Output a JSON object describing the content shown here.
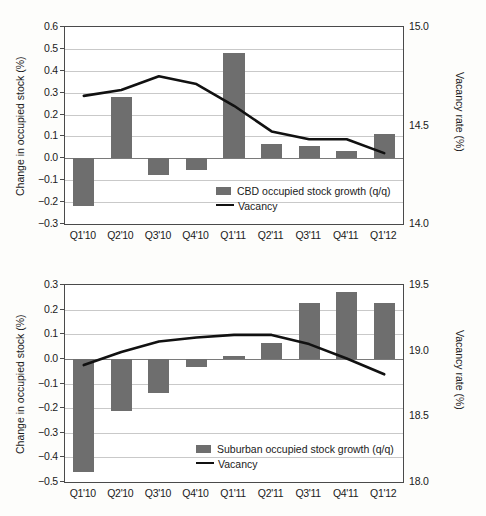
{
  "colors": {
    "bar": "#6e6e6e",
    "line": "#111111",
    "grid": "#c9c9c9",
    "axis": "#4a4a4a",
    "background": "#ffffff"
  },
  "chart_data": [
    {
      "type": "bar",
      "id": "cbd",
      "title": "",
      "xlabel": "",
      "ylabel": "Change in occupied stock (%)",
      "y2label": "Vacancy rate (%)",
      "categories": [
        "Q1'10",
        "Q2'10",
        "Q3'10",
        "Q4'10",
        "Q1'11",
        "Q2'11",
        "Q3'11",
        "Q4'11",
        "Q1'12"
      ],
      "ylim": [
        -0.3,
        0.6
      ],
      "yticks": [
        "0.6",
        "0.5",
        "0.4",
        "0.3",
        "0.2",
        "0.1",
        "0.0",
        "-0.1",
        "-0.2",
        "-0.3"
      ],
      "y2lim": [
        14.0,
        15.0
      ],
      "y2ticks": [
        "15.0",
        "14.5",
        "14.0"
      ],
      "grid": true,
      "legend_position": "inside-bottom-right",
      "series": [
        {
          "name": "CBD occupied stock growth (q/q)",
          "type": "bar",
          "axis": "left",
          "values": [
            -0.22,
            0.28,
            -0.075,
            -0.055,
            0.48,
            0.065,
            0.055,
            0.035,
            0.11
          ]
        },
        {
          "name": "Vacancy",
          "type": "line",
          "axis": "right",
          "values": [
            14.65,
            14.68,
            14.75,
            14.71,
            14.6,
            14.47,
            14.43,
            14.43,
            14.36
          ]
        }
      ]
    },
    {
      "type": "bar",
      "id": "suburban",
      "title": "",
      "xlabel": "",
      "ylabel": "Change in occupied stock (%)",
      "y2label": "Vacancy rate (%)",
      "categories": [
        "Q1'10",
        "Q2'10",
        "Q3'10",
        "Q4'10",
        "Q1'11",
        "Q2'11",
        "Q3'11",
        "Q4'11",
        "Q1'12"
      ],
      "ylim": [
        -0.5,
        0.3
      ],
      "yticks": [
        "0.3",
        "0.2",
        "0.1",
        "0.0",
        "-0.1",
        "-0.2",
        "-0.3",
        "-0.4",
        "-0.5"
      ],
      "y2lim": [
        18.0,
        19.5
      ],
      "y2ticks": [
        "19.5",
        "19.0",
        "18.5",
        "18.0"
      ],
      "grid": true,
      "legend_position": "inside-bottom-right",
      "series": [
        {
          "name": "Suburban occupied stock growth (q/q)",
          "type": "bar",
          "axis": "left",
          "values": [
            -0.46,
            -0.21,
            -0.14,
            -0.035,
            0.01,
            0.065,
            0.225,
            0.27,
            0.225
          ]
        },
        {
          "name": "Vacancy",
          "type": "line",
          "axis": "right",
          "values": [
            18.89,
            18.99,
            19.07,
            19.1,
            19.12,
            19.12,
            19.05,
            18.94,
            18.82
          ]
        }
      ]
    }
  ]
}
